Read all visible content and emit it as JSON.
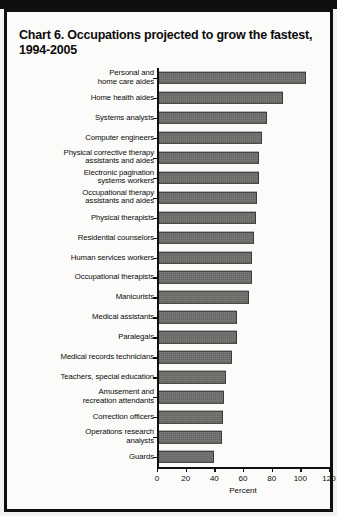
{
  "chart_data": {
    "type": "bar",
    "orientation": "horizontal",
    "title": "Chart 6. Occupations projected to grow the fastest, 1994-2005",
    "xlabel": "Percent",
    "ylabel": "",
    "xlim": [
      0,
      120
    ],
    "xticks": [
      0,
      20,
      40,
      60,
      80,
      100,
      120
    ],
    "grid": false,
    "legend": null,
    "categories": [
      "Personal and\nhome care aides",
      "Home health aides",
      "Systems analysts",
      "Computer engineers",
      "Physical corrective therapy\nassistants and aides",
      "Electronic pagination\nsystems workers",
      "Occupational therapy\nassistants and aides",
      "Physical therapists",
      "Residential counselors",
      "Human services workers",
      "Occupational therapists",
      "Manicurists",
      "Medical assistants",
      "Paralegals",
      "Medical records technicians",
      "Teachers, special education",
      "Amusement and\nrecreation attendants",
      "Correction officers",
      "Operations research\nanalysts",
      "Guards"
    ],
    "values": [
      104,
      88,
      77,
      73,
      71,
      71,
      70,
      69,
      68,
      66,
      66,
      64,
      56,
      56,
      52,
      48,
      47,
      46,
      45,
      40
    ]
  },
  "chart": {
    "title": "Chart 6. Occupations projected to grow the fastest, 1994-2005",
    "axis_title": "Percent",
    "rows": [
      {
        "label_lines": [
          "Personal and",
          "home care aides"
        ],
        "value": 104
      },
      {
        "label_lines": [
          "Home health aides"
        ],
        "value": 88
      },
      {
        "label_lines": [
          "Systems analysts"
        ],
        "value": 77
      },
      {
        "label_lines": [
          "Computer engineers"
        ],
        "value": 73
      },
      {
        "label_lines": [
          "Physical corrective therapy",
          "assistants and aides"
        ],
        "value": 71
      },
      {
        "label_lines": [
          "Electronic pagination",
          "systems workers"
        ],
        "value": 71
      },
      {
        "label_lines": [
          "Occupational therapy",
          "assistants and aides"
        ],
        "value": 70
      },
      {
        "label_lines": [
          "Physical therapists"
        ],
        "value": 69
      },
      {
        "label_lines": [
          "Residential counselors"
        ],
        "value": 68
      },
      {
        "label_lines": [
          "Human services workers"
        ],
        "value": 66
      },
      {
        "label_lines": [
          "Occupational therapists"
        ],
        "value": 66
      },
      {
        "label_lines": [
          "Manicurists"
        ],
        "value": 64
      },
      {
        "label_lines": [
          "Medical assistants"
        ],
        "value": 56
      },
      {
        "label_lines": [
          "Paralegals"
        ],
        "value": 56
      },
      {
        "label_lines": [
          "Medical records technicians"
        ],
        "value": 52
      },
      {
        "label_lines": [
          "Teachers, special education"
        ],
        "value": 48
      },
      {
        "label_lines": [
          "Amusement and",
          "recreation attendants"
        ],
        "value": 47
      },
      {
        "label_lines": [
          "Correction officers"
        ],
        "value": 46
      },
      {
        "label_lines": [
          "Operations research",
          "analysts"
        ],
        "value": 45
      },
      {
        "label_lines": [
          "Guards"
        ],
        "value": 40
      }
    ],
    "ticks": [
      {
        "label": "0",
        "value": 0
      },
      {
        "label": "20",
        "value": 20
      },
      {
        "label": "40",
        "value": 40
      },
      {
        "label": "60",
        "value": 60
      },
      {
        "label": "80",
        "value": 80
      },
      {
        "label": "100",
        "value": 100
      },
      {
        "label": "120",
        "value": 120
      }
    ],
    "colors": {
      "bar_fill": "#6c6c6a",
      "bar_border": "#3a3a38",
      "axis": "#100f0d",
      "frame": "#100f0d",
      "page": "#fbfbf9",
      "text": "#0b0b0b"
    }
  }
}
